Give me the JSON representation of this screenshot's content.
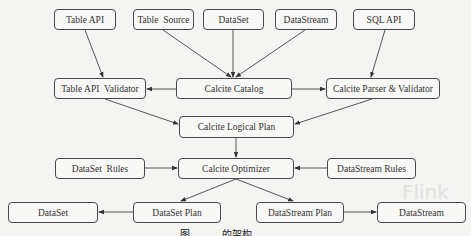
{
  "diagram": {
    "nodes": [
      {
        "id": "table_api",
        "label": "Table API"
      },
      {
        "id": "table_source",
        "label": "Table  Source"
      },
      {
        "id": "dataset_top",
        "label": "DataSet"
      },
      {
        "id": "datastream_top",
        "label": "DataStream"
      },
      {
        "id": "sql_api",
        "label": "SQL API"
      },
      {
        "id": "table_api_validator",
        "label": "Table API  Validator"
      },
      {
        "id": "calcite_catalog",
        "label": "Calcite Catalog"
      },
      {
        "id": "calcite_parser_validator",
        "label": "Calcite Parser & Validator"
      },
      {
        "id": "calcite_logical_plan",
        "label": "Calcite Logical Plan"
      },
      {
        "id": "dataset_rules",
        "label": "DataSet  Rules"
      },
      {
        "id": "calcite_optimizer",
        "label": "Calcite Optimizer"
      },
      {
        "id": "datastream_rules",
        "label": "DataStream Rules"
      },
      {
        "id": "dataset_bottom",
        "label": "DataSet"
      },
      {
        "id": "dataset_plan",
        "label": "DataSet Plan"
      },
      {
        "id": "datastream_plan",
        "label": "DataStream Plan"
      },
      {
        "id": "datastream_bottom",
        "label": "DataStream"
      }
    ],
    "edges": [
      {
        "from": "table_api",
        "to": "table_api_validator"
      },
      {
        "from": "table_source",
        "to": "calcite_catalog"
      },
      {
        "from": "dataset_top",
        "to": "calcite_catalog"
      },
      {
        "from": "datastream_top",
        "to": "calcite_catalog"
      },
      {
        "from": "sql_api",
        "to": "calcite_parser_validator"
      },
      {
        "from": "calcite_catalog",
        "to": "table_api_validator"
      },
      {
        "from": "calcite_catalog",
        "to": "calcite_parser_validator"
      },
      {
        "from": "table_api_validator",
        "to": "calcite_logical_plan"
      },
      {
        "from": "calcite_parser_validator",
        "to": "calcite_logical_plan"
      },
      {
        "from": "calcite_logical_plan",
        "to": "calcite_optimizer"
      },
      {
        "from": "dataset_rules",
        "to": "calcite_optimizer"
      },
      {
        "from": "datastream_rules",
        "to": "calcite_optimizer"
      },
      {
        "from": "calcite_optimizer",
        "to": "dataset_plan"
      },
      {
        "from": "calcite_optimizer",
        "to": "datastream_plan"
      },
      {
        "from": "dataset_plan",
        "to": "dataset_bottom"
      },
      {
        "from": "datastream_plan",
        "to": "datastream_bottom"
      }
    ],
    "caption": "图          的架构",
    "background_text": {
      "watermark": "Flink"
    }
  }
}
